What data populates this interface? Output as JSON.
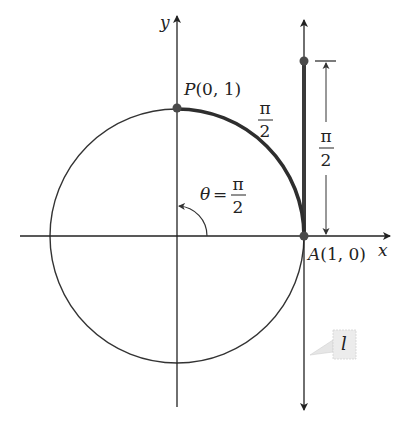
{
  "figure": {
    "type": "unit-circle-wrapping",
    "axes": {
      "x_label": "x",
      "y_label": "y"
    },
    "points": {
      "P": {
        "label": "P(0, 1)",
        "letter": "P",
        "coords": "(0, 1)"
      },
      "A": {
        "label": "A(1, 0)",
        "letter": "A",
        "coords": "(1, 0)"
      }
    },
    "arc_length": {
      "numerator": "π",
      "denominator": "2"
    },
    "tangent_length": {
      "numerator": "π",
      "denominator": "2"
    },
    "angle": {
      "symbol": "θ",
      "equals": "=",
      "numerator": "π",
      "denominator": "2"
    },
    "tangent_line_label": "l",
    "colors": {
      "axis": "#222222",
      "circle": "#333333",
      "highlight": "#3a3a3a",
      "point": "#4a4a4a",
      "callout": "#ececec"
    }
  }
}
